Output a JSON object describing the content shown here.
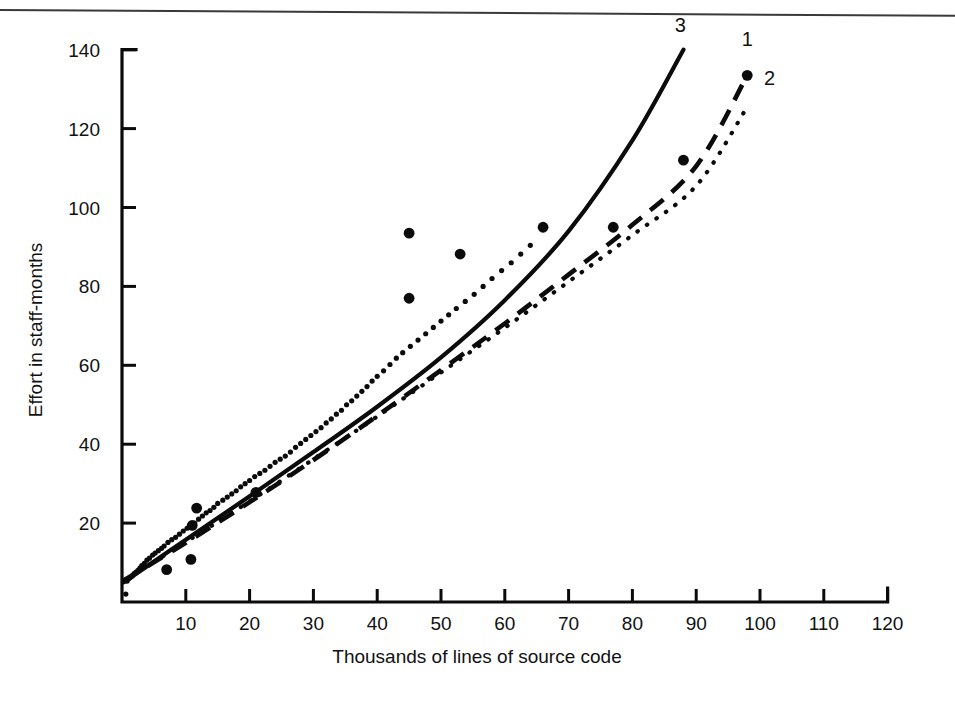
{
  "figure": {
    "background_color": "#ffffff",
    "ink_color": "#0b0b0b",
    "top_rule": "horizontal-scan-rule"
  },
  "chart_data": {
    "type": "scatter",
    "title": "",
    "subtitle": "",
    "xlabel": "Thousands of lines of source code",
    "ylabel": "Effort in staff-months",
    "xlim": [
      0,
      120
    ],
    "ylim": [
      0,
      140
    ],
    "xticks": [
      10,
      20,
      30,
      40,
      50,
      60,
      70,
      80,
      90,
      100,
      110,
      120
    ],
    "yticks": [
      20,
      40,
      60,
      80,
      100,
      120,
      140
    ],
    "xtick_labels": [
      "10",
      "20",
      "30",
      "40",
      "50",
      "60",
      "70",
      "80",
      "90",
      "100",
      "110",
      "120"
    ],
    "ytick_labels": [
      "20",
      "40",
      "60",
      "80",
      "100",
      "120",
      "140"
    ],
    "grid": false,
    "legend_position": "inline-end-of-curve",
    "annotations": [
      {
        "label": "3",
        "x": 87.5,
        "y": 144.5,
        "series": "3"
      },
      {
        "label": "1",
        "x": 98.0,
        "y": 141.0,
        "series": "1"
      },
      {
        "label": "2",
        "x": 101.5,
        "y": 131.0,
        "series": "2"
      }
    ],
    "series": [
      {
        "name": "1",
        "style": "dashed",
        "label": "1",
        "x": [
          0.3,
          10,
          20,
          30,
          40,
          50,
          60,
          70,
          80,
          90,
          98
        ],
        "values": [
          5.5,
          15.0,
          25.3,
          36.0,
          47.2,
          58.8,
          70.6,
          83.0,
          95.6,
          110.5,
          133.5
        ]
      },
      {
        "name": "2",
        "style": "dotted",
        "label": "2",
        "x": [
          0.3,
          10,
          20,
          30,
          40,
          50,
          60,
          70,
          80,
          90,
          98
        ],
        "values": [
          5.5,
          15.2,
          25.5,
          36.2,
          47.0,
          58.2,
          69.5,
          81.2,
          93.0,
          105.5,
          125.5
        ]
      },
      {
        "name": "3",
        "style": "solid",
        "label": "3",
        "x": [
          0.3,
          10,
          20,
          30,
          40,
          50,
          60,
          70,
          80,
          88
        ],
        "values": [
          5.0,
          15.8,
          26.8,
          38.0,
          49.5,
          62.0,
          76.5,
          94.0,
          117.0,
          140.0
        ]
      }
    ],
    "points": [
      {
        "x": 0.6,
        "y": 2.0,
        "size": "small"
      },
      {
        "x": 0.8,
        "y": 5.3,
        "size": "small"
      },
      {
        "x": 1.0,
        "y": 5.8,
        "size": "small"
      },
      {
        "x": 1.3,
        "y": 6.2,
        "size": "small"
      },
      {
        "x": 1.6,
        "y": 6.6,
        "size": "small"
      },
      {
        "x": 1.9,
        "y": 7.2,
        "size": "small"
      },
      {
        "x": 2.2,
        "y": 7.6,
        "size": "small"
      },
      {
        "x": 2.5,
        "y": 8.0,
        "size": "small"
      },
      {
        "x": 2.8,
        "y": 8.6,
        "size": "small"
      },
      {
        "x": 3.1,
        "y": 9.2,
        "size": "small"
      },
      {
        "x": 3.5,
        "y": 9.8,
        "size": "small"
      },
      {
        "x": 3.9,
        "y": 10.6,
        "size": "small"
      },
      {
        "x": 4.3,
        "y": 11.1,
        "size": "small"
      },
      {
        "x": 4.8,
        "y": 11.9,
        "size": "small"
      },
      {
        "x": 5.2,
        "y": 12.4,
        "size": "small"
      },
      {
        "x": 5.7,
        "y": 13.0,
        "size": "small"
      },
      {
        "x": 6.2,
        "y": 13.6,
        "size": "small"
      },
      {
        "x": 6.6,
        "y": 14.2,
        "size": "small"
      },
      {
        "x": 7.0,
        "y": 8.2,
        "size": "large"
      },
      {
        "x": 7.2,
        "y": 15.1,
        "size": "small"
      },
      {
        "x": 7.8,
        "y": 15.8,
        "size": "small"
      },
      {
        "x": 8.4,
        "y": 16.4,
        "size": "small"
      },
      {
        "x": 9.0,
        "y": 17.2,
        "size": "small"
      },
      {
        "x": 9.6,
        "y": 18.0,
        "size": "small"
      },
      {
        "x": 10.2,
        "y": 18.7,
        "size": "small"
      },
      {
        "x": 10.8,
        "y": 10.8,
        "size": "large"
      },
      {
        "x": 11.0,
        "y": 19.4,
        "size": "large"
      },
      {
        "x": 11.4,
        "y": 20.0,
        "size": "small"
      },
      {
        "x": 11.7,
        "y": 23.8,
        "size": "large"
      },
      {
        "x": 12.0,
        "y": 21.0,
        "size": "small"
      },
      {
        "x": 12.6,
        "y": 21.8,
        "size": "small"
      },
      {
        "x": 13.2,
        "y": 22.6,
        "size": "small"
      },
      {
        "x": 13.8,
        "y": 23.2,
        "size": "small"
      },
      {
        "x": 14.4,
        "y": 24.0,
        "size": "small"
      },
      {
        "x": 15.0,
        "y": 25.0,
        "size": "small"
      },
      {
        "x": 15.8,
        "y": 25.8,
        "size": "small"
      },
      {
        "x": 16.5,
        "y": 26.6,
        "size": "small"
      },
      {
        "x": 17.2,
        "y": 27.4,
        "size": "small"
      },
      {
        "x": 17.9,
        "y": 28.2,
        "size": "small"
      },
      {
        "x": 18.6,
        "y": 29.2,
        "size": "small"
      },
      {
        "x": 19.3,
        "y": 30.0,
        "size": "small"
      },
      {
        "x": 20.0,
        "y": 30.8,
        "size": "small"
      },
      {
        "x": 20.8,
        "y": 31.8,
        "size": "small"
      },
      {
        "x": 21.0,
        "y": 27.8,
        "size": "large"
      },
      {
        "x": 21.6,
        "y": 32.6,
        "size": "small"
      },
      {
        "x": 22.4,
        "y": 33.4,
        "size": "small"
      },
      {
        "x": 23.2,
        "y": 34.4,
        "size": "small"
      },
      {
        "x": 24.0,
        "y": 35.4,
        "size": "small"
      },
      {
        "x": 24.8,
        "y": 36.2,
        "size": "small"
      },
      {
        "x": 25.6,
        "y": 37.0,
        "size": "small"
      },
      {
        "x": 26.4,
        "y": 38.0,
        "size": "small"
      },
      {
        "x": 27.2,
        "y": 39.2,
        "size": "small"
      },
      {
        "x": 28.0,
        "y": 40.2,
        "size": "small"
      },
      {
        "x": 28.8,
        "y": 41.2,
        "size": "small"
      },
      {
        "x": 29.6,
        "y": 42.2,
        "size": "small"
      },
      {
        "x": 30.4,
        "y": 43.2,
        "size": "small"
      },
      {
        "x": 31.2,
        "y": 44.2,
        "size": "small"
      },
      {
        "x": 32.0,
        "y": 45.4,
        "size": "small"
      },
      {
        "x": 32.8,
        "y": 46.4,
        "size": "small"
      },
      {
        "x": 33.6,
        "y": 47.6,
        "size": "small"
      },
      {
        "x": 34.4,
        "y": 48.6,
        "size": "small"
      },
      {
        "x": 35.2,
        "y": 50.0,
        "size": "small"
      },
      {
        "x": 36.0,
        "y": 51.0,
        "size": "small"
      },
      {
        "x": 36.8,
        "y": 52.2,
        "size": "small"
      },
      {
        "x": 37.6,
        "y": 53.4,
        "size": "small"
      },
      {
        "x": 38.4,
        "y": 54.6,
        "size": "small"
      },
      {
        "x": 39.2,
        "y": 56.0,
        "size": "small"
      },
      {
        "x": 40.0,
        "y": 57.2,
        "size": "small"
      },
      {
        "x": 41.0,
        "y": 58.6,
        "size": "small"
      },
      {
        "x": 42.0,
        "y": 60.2,
        "size": "small"
      },
      {
        "x": 43.0,
        "y": 61.8,
        "size": "small"
      },
      {
        "x": 44.0,
        "y": 63.2,
        "size": "small"
      },
      {
        "x": 45.0,
        "y": 93.5,
        "size": "large"
      },
      {
        "x": 45.0,
        "y": 77.0,
        "size": "large"
      },
      {
        "x": 45.2,
        "y": 64.8,
        "size": "small"
      },
      {
        "x": 46.4,
        "y": 66.4,
        "size": "small"
      },
      {
        "x": 47.6,
        "y": 68.0,
        "size": "small"
      },
      {
        "x": 48.8,
        "y": 69.6,
        "size": "small"
      },
      {
        "x": 50.0,
        "y": 71.2,
        "size": "small"
      },
      {
        "x": 51.2,
        "y": 72.8,
        "size": "small"
      },
      {
        "x": 52.4,
        "y": 74.4,
        "size": "small"
      },
      {
        "x": 53.0,
        "y": 88.2,
        "size": "large"
      },
      {
        "x": 53.8,
        "y": 76.2,
        "size": "small"
      },
      {
        "x": 55.2,
        "y": 78.0,
        "size": "small"
      },
      {
        "x": 56.6,
        "y": 80.0,
        "size": "small"
      },
      {
        "x": 58.0,
        "y": 82.0,
        "size": "small"
      },
      {
        "x": 59.5,
        "y": 84.0,
        "size": "small"
      },
      {
        "x": 61.0,
        "y": 86.0,
        "size": "small"
      },
      {
        "x": 62.5,
        "y": 88.2,
        "size": "small"
      },
      {
        "x": 64.0,
        "y": 90.4,
        "size": "small"
      },
      {
        "x": 66.0,
        "y": 95.0,
        "size": "large"
      },
      {
        "x": 77.0,
        "y": 95.0,
        "size": "large"
      },
      {
        "x": 88.0,
        "y": 112.0,
        "size": "large"
      },
      {
        "x": 98.0,
        "y": 133.5,
        "size": "large"
      }
    ]
  }
}
